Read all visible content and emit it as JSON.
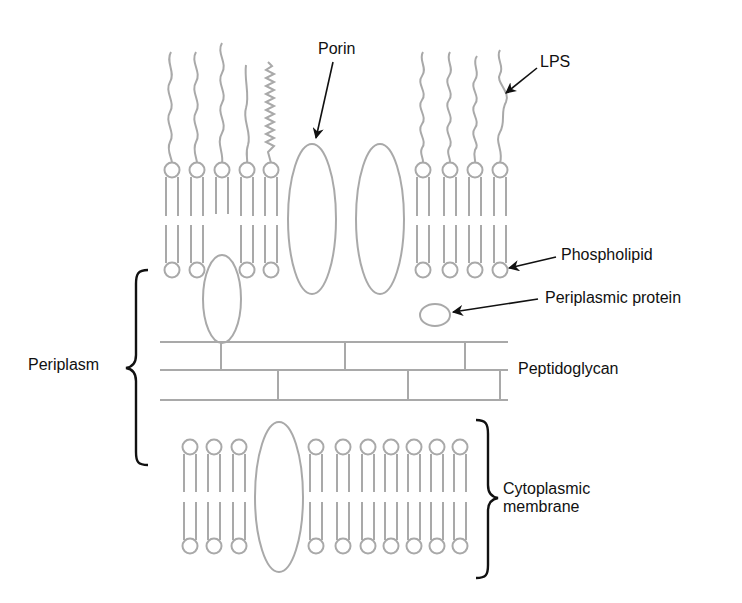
{
  "diagram": {
    "colors": {
      "structure": "#a9a9a9",
      "label": "#111111",
      "background": "#ffffff"
    },
    "labels": {
      "porin": "Porin",
      "lps": "LPS",
      "phospholipid": "Phospholipid",
      "periplasmic_protein": "Periplasmic protein",
      "peptidoglycan": "Peptidoglycan",
      "periplasm": "Periplasm",
      "cytoplasmic_membrane_line1": "Cytoplasmic",
      "cytoplasmic_membrane_line2": "membrane"
    },
    "outer_membrane": {
      "left_lipids_with_lps": 5,
      "porins": 2,
      "right_lipids_with_lps": 4
    },
    "cytoplasmic_membrane": {
      "left_lipids": 3,
      "proteins": 1,
      "right_lipids": 7
    },
    "peptidoglycan_layers": 2
  }
}
